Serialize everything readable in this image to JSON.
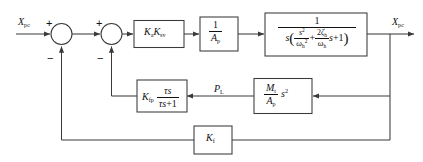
{
  "diagram": {
    "type": "control-block-diagram",
    "stroke_color": "#3a3a3a",
    "text_color": "#111111",
    "background": "#ffffff"
  },
  "signals": {
    "input": {
      "base": "X",
      "sub": "pc",
      "label": "X_pc"
    },
    "output": {
      "base": "X",
      "sub": "pc",
      "label": "X_pc"
    },
    "load_pressure": {
      "base": "P",
      "sub": "L",
      "label": "P_L"
    }
  },
  "summers": [
    {
      "name": "summing-junction-1",
      "inputs": [
        {
          "port": "left",
          "sign": "+"
        },
        {
          "port": "bottom",
          "sign": "−"
        }
      ]
    },
    {
      "name": "summing-junction-2",
      "inputs": [
        {
          "port": "left",
          "sign": "+"
        },
        {
          "port": "bottom",
          "sign": "−"
        }
      ]
    }
  ],
  "blocks": {
    "gain": {
      "name": "amplifier-servovalve-gain",
      "terms": [
        {
          "base": "K",
          "sub": "a"
        },
        {
          "base": "K",
          "sub": "sv"
        }
      ]
    },
    "area": {
      "name": "piston-area-block",
      "numerator": "1",
      "denominator": {
        "base": "A",
        "sub": "p"
      }
    },
    "plant": {
      "name": "hydraulic-actuator-transfer-function",
      "numerator": "1",
      "denominator": {
        "leading": "s",
        "group": [
          {
            "num": {
              "base": "s",
              "sup": "2"
            },
            "den": {
              "base": "ω",
              "sub": "h",
              "sup": "2"
            }
          },
          {
            "op": "+"
          },
          {
            "num": {
              "coef": "2",
              "base": "ζ",
              "sub": "h"
            },
            "den": {
              "base": "ω",
              "sub": "h"
            },
            "trail": "s"
          },
          {
            "op": "+"
          },
          {
            "term": "1"
          }
        ]
      }
    },
    "washout": {
      "name": "pressure-feedback-washout-filter",
      "gain": {
        "base": "K",
        "sub": "fp"
      },
      "numerator": {
        "tau": "τ",
        "s": "s"
      },
      "denominator": {
        "tau": "τ",
        "s": "s",
        "plus": "+1"
      }
    },
    "mass": {
      "name": "load-mass-over-area-block",
      "numerator": {
        "base": "M",
        "sub": "t"
      },
      "denominator": {
        "base": "A",
        "sub": "p"
      },
      "multiplier": {
        "base": "s",
        "sup": "2"
      }
    },
    "feedback": {
      "name": "position-feedback-gain",
      "term": {
        "base": "K",
        "sub": "f"
      }
    }
  }
}
